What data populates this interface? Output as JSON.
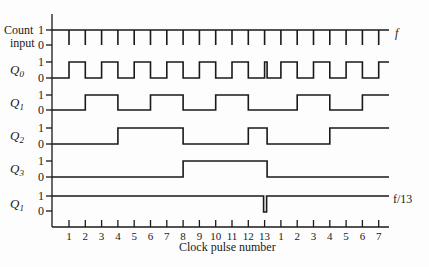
{
  "diagram": {
    "type": "timing-diagram",
    "x_axis": {
      "label": "Clock pulse number",
      "ticks": [
        "1",
        "2",
        "3",
        "4",
        "5",
        "6",
        "7",
        "8",
        "9",
        "10",
        "11",
        "12",
        "13",
        "1",
        "2",
        "3",
        "4",
        "5",
        "6",
        "7"
      ]
    },
    "level_labels": {
      "high": "1",
      "low": "0"
    },
    "signals": [
      {
        "id": "count",
        "label_line1": "Count",
        "label_line2": "input",
        "right_label": "f"
      },
      {
        "id": "q0",
        "label": "Q",
        "sub": "0",
        "right_label": ""
      },
      {
        "id": "q1",
        "label": "Q",
        "sub": "1",
        "right_label": ""
      },
      {
        "id": "q2",
        "label": "Q",
        "sub": "2",
        "right_label": ""
      },
      {
        "id": "q3",
        "label": "Q",
        "sub": "3",
        "right_label": ""
      },
      {
        "id": "out",
        "label": "Q",
        "sub": "1",
        "right_label": "f/13"
      }
    ],
    "counter_states_after_pulse": [
      0,
      1,
      2,
      3,
      4,
      5,
      6,
      7,
      8,
      9,
      10,
      11,
      12,
      0,
      1,
      2,
      3,
      4,
      5,
      6,
      7
    ],
    "glitch_at_pulse": 13,
    "modulus": 13
  }
}
